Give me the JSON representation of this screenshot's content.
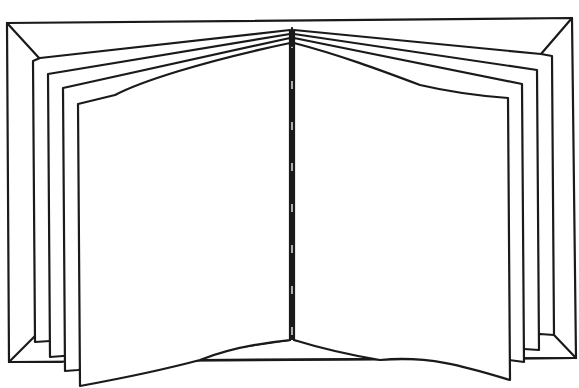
{
  "figure": {
    "title": "Open book line drawing",
    "style": "black line art on white",
    "colors": {
      "line": "#1a1a1a",
      "background": "#ffffff"
    },
    "pages_per_side": 4,
    "spine": {
      "style": "dashed",
      "dash": 33,
      "gap": 8
    }
  }
}
